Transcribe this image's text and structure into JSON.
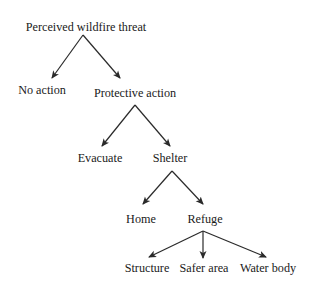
{
  "diagram": {
    "type": "tree",
    "root": "Perceived wildfire threat",
    "nodes": {
      "threat": {
        "label": "Perceived wildfire threat",
        "x": 86,
        "y": 27
      },
      "no_action": {
        "label": "No action",
        "x": 42,
        "y": 90
      },
      "protective": {
        "label": "Protective action",
        "x": 135,
        "y": 93
      },
      "evacuate": {
        "label": "Evacuate",
        "x": 100,
        "y": 158
      },
      "shelter": {
        "label": "Shelter",
        "x": 170,
        "y": 158
      },
      "home": {
        "label": "Home",
        "x": 141,
        "y": 219
      },
      "refuge": {
        "label": "Refuge",
        "x": 205,
        "y": 219
      },
      "structure": {
        "label": "Structure",
        "x": 147,
        "y": 268
      },
      "safer_area": {
        "label": "Safer area",
        "x": 204,
        "y": 268
      },
      "water_body": {
        "label": "Water body",
        "x": 268,
        "y": 268
      }
    },
    "edges": [
      {
        "from": "threat",
        "to": "no_action"
      },
      {
        "from": "threat",
        "to": "protective"
      },
      {
        "from": "protective",
        "to": "evacuate"
      },
      {
        "from": "protective",
        "to": "shelter"
      },
      {
        "from": "shelter",
        "to": "home"
      },
      {
        "from": "shelter",
        "to": "refuge"
      },
      {
        "from": "refuge",
        "to": "structure"
      },
      {
        "from": "refuge",
        "to": "safer_area"
      },
      {
        "from": "refuge",
        "to": "water_body"
      }
    ],
    "colors": {
      "line": "#2a2a2a",
      "text": "#1a1a1a",
      "background": "#ffffff"
    }
  }
}
